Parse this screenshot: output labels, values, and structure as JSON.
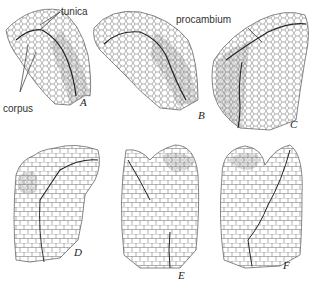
{
  "figure": {
    "labels": {
      "tunica": "tunica",
      "corpus": "corpus",
      "procambium": "procambium"
    },
    "panels": [
      {
        "id": "A",
        "letter": "A"
      },
      {
        "id": "B",
        "letter": "B"
      },
      {
        "id": "C",
        "letter": "C"
      },
      {
        "id": "D",
        "letter": "D"
      },
      {
        "id": "E",
        "letter": "E"
      },
      {
        "id": "F",
        "letter": "F"
      }
    ],
    "colors": {
      "cell_line": "#555555",
      "boundary_line": "#222222",
      "background": "#ffffff"
    }
  }
}
